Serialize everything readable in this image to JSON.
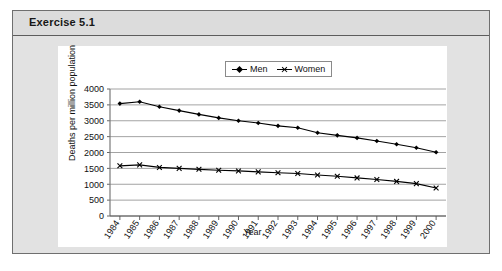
{
  "exercise": {
    "title": "Exercise 5.1"
  },
  "chart_data": {
    "type": "line",
    "title": "",
    "xlabel": "Year",
    "ylabel": "Deaths per million population",
    "grid": true,
    "legend_position": "top-center",
    "ylim": [
      0,
      4000
    ],
    "yticks": [
      "0",
      "500",
      "1000",
      "1500",
      "2000",
      "2500",
      "3000",
      "3500",
      "4000"
    ],
    "categories": [
      "1984",
      "1985",
      "1986",
      "1987",
      "1988",
      "1989",
      "1990",
      "1991",
      "1992",
      "1993",
      "1994",
      "1995",
      "1996",
      "1997",
      "1998",
      "1999",
      "2000"
    ],
    "series": [
      {
        "name": "Men",
        "marker": "diamond",
        "values": [
          3540,
          3600,
          3440,
          3320,
          3200,
          3090,
          3000,
          2930,
          2840,
          2780,
          2620,
          2540,
          2460,
          2360,
          2260,
          2150,
          2010
        ]
      },
      {
        "name": "Women",
        "marker": "cross",
        "values": [
          1580,
          1610,
          1530,
          1500,
          1470,
          1440,
          1420,
          1390,
          1360,
          1340,
          1290,
          1250,
          1200,
          1150,
          1090,
          1020,
          880
        ]
      }
    ]
  },
  "colors": {
    "series_line": "#000000",
    "grid": "#8c8c8c",
    "panel_bg": "#ffffff",
    "box_bg": "#e2e2e2",
    "header_bg": "#dcdcdc"
  }
}
